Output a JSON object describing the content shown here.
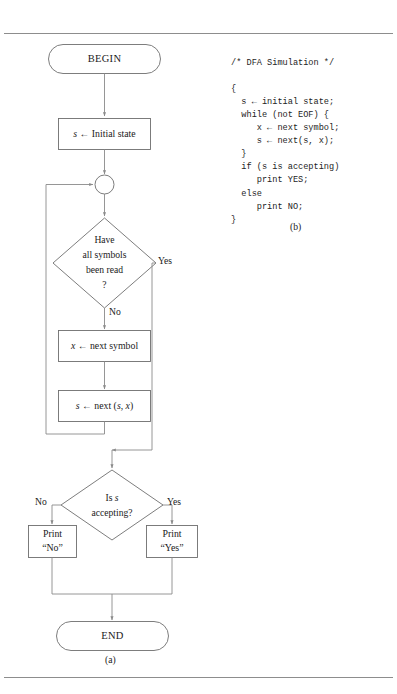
{
  "figure": {
    "caption_a": "(a)",
    "caption_b": "(b)"
  },
  "flowchart": {
    "nodes": {
      "begin": {
        "label": "BEGIN",
        "shape": "terminal"
      },
      "init_state": {
        "label": "s ← Initial state",
        "shape": "process",
        "italic_var": "s"
      },
      "merge": {
        "label": "",
        "shape": "connector-circle"
      },
      "decision_symbols": {
        "shape": "decision",
        "line1": "Have",
        "line2": "all symbols",
        "line3": "been read",
        "line4": "?"
      },
      "next_symbol": {
        "label": "x ← next symbol",
        "shape": "process",
        "italic_var": "x"
      },
      "next_state": {
        "label": "s ← next (s, x)",
        "shape": "process",
        "italic_var": "s"
      },
      "decision_accept": {
        "shape": "decision",
        "line1": "Is s",
        "line2": "accepting?"
      },
      "print_no": {
        "shape": "process",
        "line1": "Print",
        "line2": "“No”"
      },
      "print_yes": {
        "shape": "process",
        "line1": "Print",
        "line2": "“Yes”"
      },
      "end": {
        "label": "END",
        "shape": "terminal"
      }
    },
    "branch_labels": {
      "symbols_yes": "Yes",
      "symbols_no": "No",
      "accept_no": "No",
      "accept_yes": "Yes"
    }
  },
  "code": {
    "title_comment": "/* DFA Simulation */",
    "lines": [
      "/* DFA Simulation */",
      "",
      "{",
      "  s ← initial state;",
      "  while (not EOF) {",
      "     x ← next symbol;",
      "     s ← next(s, x);",
      "  }",
      "  if (s is accepting)",
      "     print YES;",
      "  else",
      "     print NO;",
      "}"
    ],
    "text": "/* DFA Simulation */\n\n{\n  s ← initial state;\n  while (not EOF) {\n     x ← next symbol;\n     s ← next(s, x);\n  }\n  if (s is accepting)\n     print YES;\n  else\n     print NO;\n}"
  },
  "colors": {
    "stroke": "#6e6e6e",
    "connector": "#8a8a8a",
    "rule": "#8d8d8d",
    "text": "#1a1a1a",
    "background": "#ffffff"
  }
}
